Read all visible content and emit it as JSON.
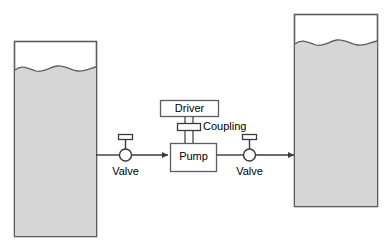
{
  "diagram": {
    "colors": {
      "background": "#ffffff",
      "outline": "#5c5c5c",
      "liquid_fill": "#d6d6d6",
      "tank_air_fill": "#ffffff",
      "box_fill": "#ffffff",
      "line": "#3a3a3a",
      "text": "#000000"
    },
    "tanks": [
      {
        "id": "suction-tank",
        "name": "left-tank",
        "label": "",
        "liquid_level_pct": 80,
        "surface": "wavy"
      },
      {
        "id": "discharge-tank",
        "name": "right-tank",
        "label": "",
        "liquid_level_pct": 84,
        "surface": "wavy"
      }
    ],
    "components": {
      "driver": {
        "label": "Driver"
      },
      "coupling": {
        "label": "Coupling"
      },
      "pump": {
        "label": "Pump"
      },
      "suction_valve": {
        "label": "Valve"
      },
      "discharge_valve": {
        "label": "Valve"
      }
    },
    "flow": {
      "direction": "left-to-right",
      "arrow_into_pump": true,
      "arrow_into_discharge_tank": true
    }
  }
}
